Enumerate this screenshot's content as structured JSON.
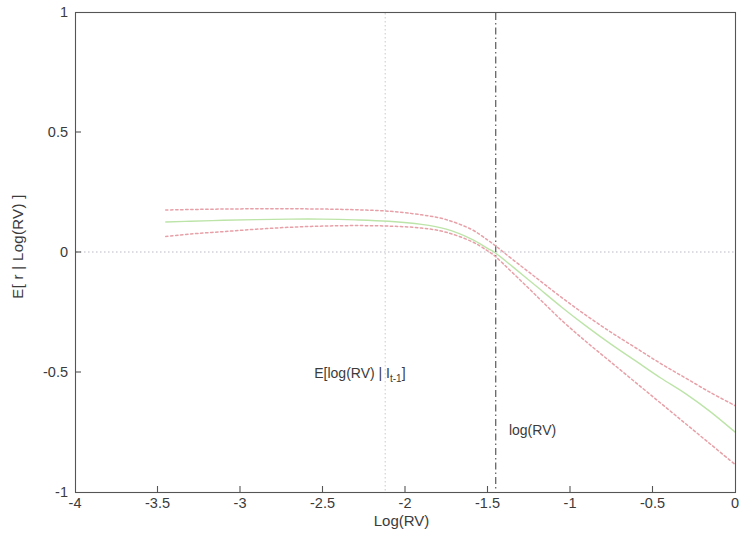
{
  "chart_data": {
    "type": "line",
    "title": "",
    "xlabel": "Log(RV)",
    "ylabel": "E[ r | Log(RV) ]",
    "xlim": [
      -4,
      0
    ],
    "ylim": [
      -1,
      1
    ],
    "xticks": [
      -4,
      -3.5,
      -3,
      -2.5,
      -2,
      -1.5,
      -1,
      -0.5,
      0
    ],
    "xtick_labels": [
      "-4",
      "-3.5",
      "-3",
      "-2.5",
      "-2",
      "-1.5",
      "-1",
      "-0.5",
      "0"
    ],
    "yticks": [
      -1,
      -0.5,
      0,
      0.5,
      1
    ],
    "ytick_labels": [
      "-1",
      "-0.5",
      "0",
      "0.5",
      "1"
    ],
    "grid": false,
    "legend_position": "none",
    "series": [
      {
        "name": "upper confidence band",
        "style": "dotted",
        "color": "#e8a0a8",
        "x": [
          -3.45,
          -3.3,
          -3.1,
          -2.9,
          -2.7,
          -2.5,
          -2.3,
          -2.1,
          -1.9,
          -1.75,
          -1.6,
          -1.5,
          -1.45,
          -1.35,
          -1.2,
          -1.05,
          -0.9,
          -0.75,
          -0.6,
          -0.45,
          -0.3,
          -0.15,
          0
        ],
        "y": [
          0.175,
          0.177,
          0.179,
          0.18,
          0.18,
          0.179,
          0.176,
          0.17,
          0.155,
          0.135,
          0.095,
          0.05,
          0.025,
          -0.03,
          -0.11,
          -0.19,
          -0.265,
          -0.335,
          -0.4,
          -0.465,
          -0.525,
          -0.585,
          -0.64
        ]
      },
      {
        "name": "conditional mean",
        "style": "solid",
        "color": "#bde4a8",
        "x": [
          -3.45,
          -3.3,
          -3.1,
          -2.9,
          -2.7,
          -2.5,
          -2.3,
          -2.1,
          -1.9,
          -1.75,
          -1.6,
          -1.5,
          -1.45,
          -1.35,
          -1.2,
          -1.05,
          -0.9,
          -0.75,
          -0.6,
          -0.45,
          -0.3,
          -0.15,
          0
        ],
        "y": [
          0.125,
          0.128,
          0.132,
          0.135,
          0.137,
          0.137,
          0.134,
          0.128,
          0.115,
          0.095,
          0.055,
          0.015,
          -0.005,
          -0.06,
          -0.145,
          -0.23,
          -0.31,
          -0.385,
          -0.455,
          -0.525,
          -0.59,
          -0.665,
          -0.75
        ]
      },
      {
        "name": "lower confidence band",
        "style": "dotted",
        "color": "#e8a0a8",
        "x": [
          -3.45,
          -3.3,
          -3.1,
          -2.9,
          -2.7,
          -2.5,
          -2.3,
          -2.1,
          -1.9,
          -1.75,
          -1.6,
          -1.5,
          -1.45,
          -1.35,
          -1.2,
          -1.05,
          -0.9,
          -0.75,
          -0.6,
          -0.45,
          -0.3,
          -0.15,
          0
        ],
        "y": [
          0.065,
          0.075,
          0.085,
          0.095,
          0.103,
          0.108,
          0.11,
          0.108,
          0.1,
          0.082,
          0.045,
          0.005,
          -0.02,
          -0.085,
          -0.185,
          -0.285,
          -0.375,
          -0.46,
          -0.545,
          -0.63,
          -0.715,
          -0.8,
          -0.885
        ]
      }
    ],
    "reference_lines": [
      {
        "name": "zero-line",
        "orientation": "horizontal",
        "value": 0,
        "style": "dotted",
        "color": "#b9b9c4"
      },
      {
        "name": "expected-log-rv-line",
        "orientation": "vertical",
        "value": -2.12,
        "style": "dotted",
        "color": "#c9c9d2"
      },
      {
        "name": "log-rv-line",
        "orientation": "vertical",
        "value": -1.45,
        "style": "dashdot",
        "color": "#4a4a4a"
      }
    ],
    "annotations": [
      {
        "name": "expected-log-rv-annotation",
        "text": "E[log(RV) | I",
        "sub": "t-1",
        "text_tail": "]",
        "x": -2.55,
        "y": -0.51
      },
      {
        "name": "log-rv-annotation",
        "text": "log(RV)",
        "x": -1.37,
        "y": -0.745
      }
    ]
  },
  "axes": {
    "frame_color": "#555555",
    "background": "#ffffff"
  }
}
